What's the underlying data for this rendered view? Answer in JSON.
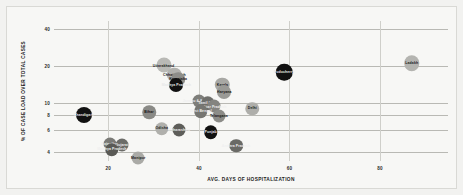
{
  "chart_data": {
    "type": "scatter",
    "title": "",
    "xlabel": "AVG. DAYS OF HOSPITALIZATION",
    "ylabel": "% OF CASE LOAD OVER TOTAL CASES",
    "xlim": [
      8,
      95
    ],
    "ylim": [
      3.4,
      46
    ],
    "yscale": "log",
    "grid": true,
    "legend": "none",
    "xticks": [
      "20",
      "40",
      "60",
      "80"
    ],
    "xtick_values": [
      20,
      40,
      60,
      80
    ],
    "yticks": [
      "4",
      "6",
      "8",
      "10",
      "20",
      "40"
    ],
    "ytick_values": [
      4,
      6,
      8,
      10,
      20,
      40
    ],
    "points": [
      {
        "label": "Ladakh",
        "x": 87.0,
        "y": 21.0,
        "size": 15.5,
        "color": "#b4b4b0",
        "text_color": "#1a1a1a"
      },
      {
        "label": "Uttarakhand",
        "x": 32.2,
        "y": 20.2,
        "size": 15.0,
        "color": "#b9b9b5",
        "text_color": "#1a1a1a"
      },
      {
        "label": "Puducherry",
        "x": 58.8,
        "y": 17.8,
        "size": 16.5,
        "color": "#111111",
        "text_color": "#e8e8e8"
      },
      {
        "label": "Chhattisgarh",
        "x": 34.6,
        "y": 16.9,
        "size": 14.5,
        "color": "#b2b2ae",
        "text_color": "#1a1a1a"
      },
      {
        "label": "Karnataka",
        "x": 35.4,
        "y": 15.6,
        "size": 13.5,
        "color": "#8e8e8a",
        "text_color": "#141414"
      },
      {
        "label": "Madhya Pradesh",
        "x": 35.0,
        "y": 14.1,
        "size": 14.0,
        "color": "#111111",
        "text_color": "#e8e8e8"
      },
      {
        "label": "Kerala",
        "x": 45.2,
        "y": 14.0,
        "size": 14.5,
        "color": "#a8a8a4",
        "text_color": "#1a1a1a"
      },
      {
        "label": "Haryana",
        "x": 45.6,
        "y": 12.2,
        "size": 14.0,
        "color": "#9a9a96",
        "text_color": "#141414"
      },
      {
        "label": "Jammu & Kashmir",
        "x": 40.0,
        "y": 10.4,
        "size": 13.0,
        "color": "#7e7e7a",
        "text_color": "#f0f0f0"
      },
      {
        "label": "Tamil Nadu",
        "x": 42.0,
        "y": 10.0,
        "size": 13.5,
        "color": "#6f6f6b",
        "text_color": "#f0f0f0"
      },
      {
        "label": "Uttar Pradesh",
        "x": 43.4,
        "y": 9.4,
        "size": 13.0,
        "color": "#848480",
        "text_color": "#f0f0f0"
      },
      {
        "label": "Delhi",
        "x": 51.8,
        "y": 9.0,
        "size": 13.5,
        "color": "#aeaeaa",
        "text_color": "#1a1a1a"
      },
      {
        "label": "West Bengal",
        "x": 40.4,
        "y": 8.6,
        "size": 13.5,
        "color": "#767672",
        "text_color": "#f0f0f0"
      },
      {
        "label": "Bihar",
        "x": 29.0,
        "y": 8.4,
        "size": 13.5,
        "color": "#8a8a86",
        "text_color": "#141414"
      },
      {
        "label": "Telangana",
        "x": 44.4,
        "y": 7.9,
        "size": 13.0,
        "color": "#8c8c88",
        "text_color": "#141414"
      },
      {
        "label": "Chandigarh",
        "x": 14.6,
        "y": 8.0,
        "size": 16.0,
        "color": "#111111",
        "text_color": "#e8e8e8"
      },
      {
        "label": "Odisha",
        "x": 31.8,
        "y": 6.2,
        "size": 13.5,
        "color": "#b0b0ac",
        "text_color": "#1a1a1a"
      },
      {
        "label": "Maharashtra",
        "x": 35.6,
        "y": 6.1,
        "size": 13.0,
        "color": "#5e5e5a",
        "text_color": "#f0f0f0"
      },
      {
        "label": "Punjab",
        "x": 42.6,
        "y": 5.8,
        "size": 13.5,
        "color": "#111111",
        "text_color": "#e8e8e8"
      },
      {
        "label": "Rajasthan",
        "x": 20.4,
        "y": 4.7,
        "size": 13.0,
        "color": "#7a7a76",
        "text_color": "#f0f0f0"
      },
      {
        "label": "Gujarat",
        "x": 23.0,
        "y": 4.6,
        "size": 13.0,
        "color": "#6c6c68",
        "text_color": "#f0f0f0"
      },
      {
        "label": "Madhya Pradesh 2",
        "x": 20.8,
        "y": 4.2,
        "size": 13.5,
        "color": "#5a5a56",
        "text_color": "#f0f0f0"
      },
      {
        "label": "Andhra Pradesh",
        "x": 48.2,
        "y": 4.5,
        "size": 13.5,
        "color": "#6a6a66",
        "text_color": "#f0f0f0"
      },
      {
        "label": "Manipur",
        "x": 26.6,
        "y": 3.6,
        "size": 13.0,
        "color": "#aaaaa6",
        "text_color": "#1a1a1a"
      }
    ]
  }
}
